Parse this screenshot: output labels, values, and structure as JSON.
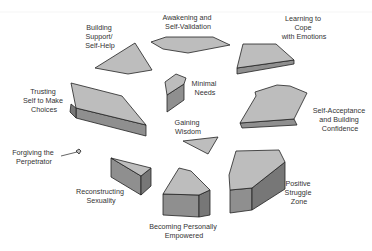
{
  "diagram": {
    "type": "cluster-of-3d-polygons",
    "colors": {
      "top_face": "#bdbdbd",
      "side_face": "#8f8f8f",
      "dark_side": "#777777",
      "outline": "#222222",
      "text": "#333333"
    },
    "nodes": [
      {
        "id": "awakening",
        "lines": [
          "Awakening and",
          "Self-Validation"
        ]
      },
      {
        "id": "building-support",
        "lines": [
          "Building",
          "Support/",
          "Self-Help"
        ]
      },
      {
        "id": "learning-cope",
        "lines": [
          "Learning to",
          "Cope",
          "with Emotions"
        ]
      },
      {
        "id": "minimal-needs",
        "lines": [
          "Minimal",
          "Needs"
        ]
      },
      {
        "id": "trusting-self",
        "lines": [
          "Trusting",
          "Self to Make",
          "Choices"
        ]
      },
      {
        "id": "self-acceptance",
        "lines": [
          "Self-Acceptance",
          "and Building",
          "Confidence"
        ]
      },
      {
        "id": "gaining-wisdom",
        "lines": [
          "Gaining",
          "Wisdom"
        ]
      },
      {
        "id": "forgiving",
        "lines": [
          "Forgiving the",
          "Perpetrator"
        ]
      },
      {
        "id": "positive-struggle",
        "lines": [
          "Positive",
          "Struggle",
          "Zone"
        ]
      },
      {
        "id": "reconstructing",
        "lines": [
          "Reconstructing",
          "Sexuality"
        ]
      },
      {
        "id": "becoming-empowered",
        "lines": [
          "Becoming Personally",
          "Empowered"
        ]
      }
    ]
  }
}
